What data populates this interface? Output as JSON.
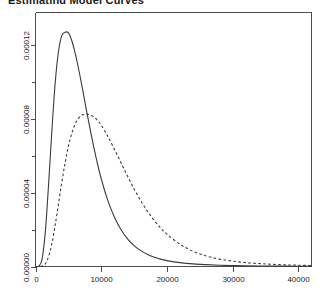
{
  "chart_data": {
    "type": "line",
    "title": "Estimating Model Curves",
    "xlabel": "",
    "ylabel": "",
    "xlim": [
      0,
      42000
    ],
    "ylim": [
      0,
      0.0001375
    ],
    "grid": false,
    "legend_position": "none",
    "x_ticks": [
      0,
      10000,
      20000,
      30000,
      40000
    ],
    "x_tick_labels": [
      "0",
      "10000",
      "20000",
      "30000",
      "40000"
    ],
    "y_ticks": [
      0.0,
      4e-05,
      8e-05,
      0.00012
    ],
    "y_tick_labels": [
      "0.000000",
      "0.000040",
      "0.000080",
      "0.000120"
    ],
    "y_tick_labels_display": [
      "0.00000",
      "0.00004",
      "0.00008",
      "0.00012"
    ],
    "y_minor_ticks": [
      2e-05,
      6e-05,
      0.0001
    ],
    "series": [
      {
        "name": "solid-curve",
        "style": "solid",
        "color": "#3a3a3a",
        "peak_x": 5000,
        "peak_y": 0.0001265,
        "x": [
          0,
          500,
          1000,
          1500,
          2000,
          2500,
          3000,
          3500,
          4000,
          4500,
          5000,
          5500,
          6000,
          6500,
          7000,
          7500,
          8000,
          9000,
          10000,
          11000,
          12000,
          13000,
          14000,
          15000,
          16000,
          17000,
          18000,
          19000,
          20000,
          22000,
          24000,
          26000,
          28000,
          30000,
          32000,
          34000,
          36000,
          38000,
          40000,
          42000
        ],
        "y": [
          0.0,
          2e-07,
          4e-06,
          1.9e-05,
          4.5e-05,
          7.4e-05,
          9.95e-05,
          0.0001165,
          0.000125,
          0.0001268,
          0.0001265,
          0.0001225,
          0.000116,
          0.000108,
          9.9e-05,
          8.95e-05,
          8e-05,
          6.25e-05,
          4.75e-05,
          3.58e-05,
          2.68e-05,
          2e-05,
          1.5e-05,
          1.13e-05,
          8.6e-06,
          6.6e-06,
          5.1e-06,
          4e-06,
          3.2e-06,
          2.1e-06,
          1.4e-06,
          1e-06,
          7e-07,
          5e-07,
          4e-07,
          3e-07,
          2e-07,
          2e-07,
          1e-07,
          1e-07
        ]
      },
      {
        "name": "dashed-curve",
        "style": "dashed",
        "color": "#3a3a3a",
        "peak_x": 9000,
        "peak_y": 8.25e-05,
        "x": [
          0,
          500,
          1000,
          1500,
          2000,
          2500,
          3000,
          3500,
          4000,
          4500,
          5000,
          5500,
          6000,
          6500,
          7000,
          7500,
          8000,
          8500,
          9000,
          9500,
          10000,
          11000,
          12000,
          13000,
          14000,
          15000,
          16000,
          17000,
          18000,
          19000,
          20000,
          22000,
          24000,
          26000,
          28000,
          30000,
          32000,
          34000,
          36000,
          38000,
          40000,
          42000
        ],
        "y": [
          0.0,
          0.0,
          2e-07,
          1.5e-06,
          5.5e-06,
          1.25e-05,
          2.25e-05,
          3.4e-05,
          4.55e-05,
          5.6e-05,
          6.5e-05,
          7.18e-05,
          7.68e-05,
          8e-05,
          8.18e-05,
          8.25e-05,
          8.24e-05,
          8.18e-05,
          8.06e-05,
          7.88e-05,
          7.65e-05,
          7.05e-05,
          6.35e-05,
          5.62e-05,
          4.9e-05,
          4.2e-05,
          3.57e-05,
          3.01e-05,
          2.52e-05,
          2.1e-05,
          1.75e-05,
          1.2e-05,
          8.2e-06,
          5.7e-06,
          4e-06,
          2.9e-06,
          2.1e-06,
          1.6e-06,
          1.2e-06,
          9e-07,
          7e-07,
          5e-07
        ]
      }
    ]
  },
  "axes": {
    "x_axis_name": "x-axis",
    "y_axis_name": "y-axis"
  }
}
